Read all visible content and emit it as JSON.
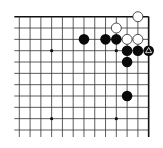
{
  "board": {
    "description": "Top-right corner of a Go board (partial diagram)",
    "columns": 13,
    "rows": 11,
    "origin_x": 19.3,
    "origin_y": 16.7,
    "spacing_x": 10.78,
    "spacing_y": 11.33,
    "line_color": "#333333",
    "edge_color": "#111111",
    "background": "#ffffff",
    "edges": {
      "top": true,
      "right": true,
      "left": false,
      "bottom": false
    },
    "star_points": [
      {
        "col": 3,
        "row": 3
      },
      {
        "col": 9,
        "row": 3
      },
      {
        "col": 3,
        "row": 9
      },
      {
        "col": 9,
        "row": 9
      }
    ],
    "stones": [
      {
        "color": "white",
        "col": 11,
        "row": 0
      },
      {
        "color": "white",
        "col": 9,
        "row": 1
      },
      {
        "color": "black",
        "col": 6,
        "row": 2
      },
      {
        "color": "black",
        "col": 8,
        "row": 2
      },
      {
        "color": "black",
        "col": 9,
        "row": 2
      },
      {
        "color": "white",
        "col": 10,
        "row": 2
      },
      {
        "color": "white",
        "col": 11,
        "row": 2
      },
      {
        "color": "black",
        "col": 10,
        "row": 3
      },
      {
        "color": "black",
        "col": 11,
        "row": 3
      },
      {
        "color": "black",
        "col": 12,
        "row": 3,
        "marker": "triangle"
      },
      {
        "color": "black",
        "col": 10,
        "row": 4
      },
      {
        "color": "black",
        "col": 10,
        "row": 7
      }
    ],
    "colors": {
      "black_stone": "#0a0a0a",
      "white_stone": "#ffffff",
      "white_stone_outline": "#222222",
      "marker": "#ffffff"
    }
  }
}
